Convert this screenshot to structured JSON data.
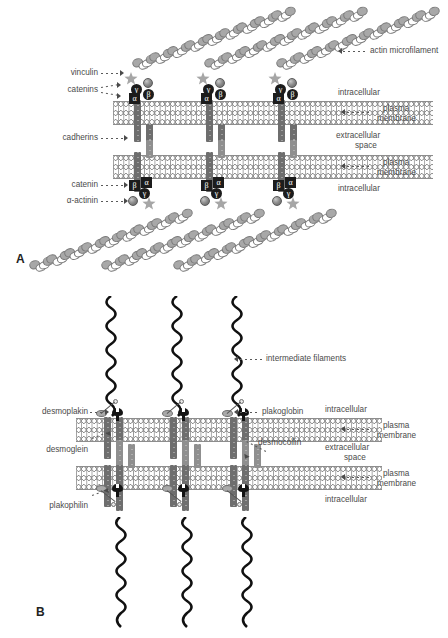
{
  "figure": {
    "panels": [
      {
        "letter": "A",
        "name": "adherens-junction",
        "labels": {
          "actin_microfilament": "actin microfilament",
          "vinculin": "vinculin",
          "catenins": "catenins",
          "cadherins": "cadherins",
          "catenin": "catenin",
          "alpha_actinin": "α-actinin",
          "intracellular_top": "intracellular",
          "plasma_membrane_top": "plasma\nmembrane",
          "plasma_membrane_top_l1": "plasma",
          "plasma_membrane_top_l2": "membrane",
          "extracellular_space_l1": "extracellular",
          "extracellular_space_l2": "space",
          "plasma_membrane_bottom_l1": "plasma",
          "plasma_membrane_bottom_l2": "membrane",
          "intracellular_bottom": "intracellular"
        },
        "catenin_glyphs_top": [
          "γ",
          "β",
          "α"
        ],
        "catenin_glyphs_bottom": [
          "β",
          "α",
          "γ"
        ],
        "complex_count": 3
      },
      {
        "letter": "B",
        "name": "desmosome",
        "labels": {
          "intermediate_filaments": "intermediate filaments",
          "desmoplakin": "desmoplakin",
          "plakoglobin": "plakoglobin",
          "desmoglein": "desmoglein",
          "desmocollin": "desmocollin",
          "plakophilin": "plakophilin",
          "intracellular_top": "intracellular",
          "plasma_membrane_top_l1": "plasma",
          "plasma_membrane_top_l2": "membrane",
          "extracellular_space_l1": "extracellular",
          "extracellular_space_l2": "space",
          "plasma_membrane_bottom_l1": "plasma",
          "plasma_membrane_bottom_l2": "membrane",
          "intracellular_bottom": "intracellular"
        },
        "complex_count": 3
      }
    ]
  },
  "colors": {
    "background": "#ffffff",
    "text": "#4a4a4a",
    "leader": "#5a5a5a",
    "membrane_head": "#8d8d8d",
    "membrane_tail": "#9a9a9a",
    "cadherin": "#6e6e6e",
    "catenin_dark": "#1c1c1c",
    "actin_filled": "#a8a8a8",
    "actin_empty": "#ffffff",
    "vinculin_star": "#a6a6a6",
    "intermediate_filament": "#111111",
    "panel_letter": "#222222"
  }
}
